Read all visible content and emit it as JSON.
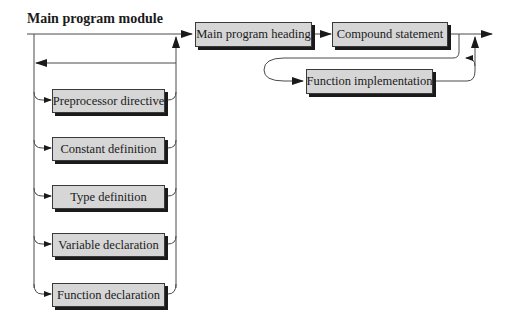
{
  "diagram": {
    "title": "Main program module",
    "type": "syntax-diagram",
    "top_boxes": {
      "main_program_heading": "Main program heading",
      "compound_statement": "Compound statement",
      "function_implementation": "Function implementation"
    },
    "declaration_boxes": [
      {
        "label": "Preprocessor directive"
      },
      {
        "label": "Constant definition"
      },
      {
        "label": "Type definition"
      },
      {
        "label": "Variable declaration"
      },
      {
        "label": "Function declaration"
      }
    ],
    "colors": {
      "box_fill": "#d6d6d6",
      "box_shadow": "#1a1a1a",
      "line": "#4a4a4a"
    }
  }
}
